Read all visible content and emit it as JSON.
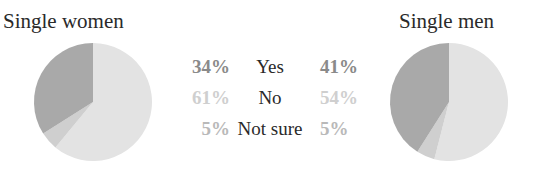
{
  "chart_data": {
    "type": "pie",
    "categories": [
      "Yes",
      "No",
      "Not sure"
    ],
    "series": [
      {
        "name": "Single women",
        "values": [
          34,
          61,
          5
        ]
      },
      {
        "name": "Single men",
        "values": [
          41,
          54,
          5
        ]
      }
    ],
    "colors": {
      "Yes": "#a9a9a9",
      "No": "#e3e3e3",
      "Not sure": "#cfcfcf"
    },
    "label_colors": {
      "Yes": "#8a8a8a",
      "No": "#cfcfcf",
      "Not sure": "#b9b9b9"
    },
    "title": "",
    "legend_position": "center"
  },
  "titles": {
    "women": "Single women",
    "men": "Single men"
  },
  "rows": [
    {
      "category": "Yes",
      "women": "34%",
      "men": "41%"
    },
    {
      "category": "No",
      "women": "61%",
      "men": "54%"
    },
    {
      "category": "Not sure",
      "women": "5%",
      "men": "5%"
    }
  ]
}
